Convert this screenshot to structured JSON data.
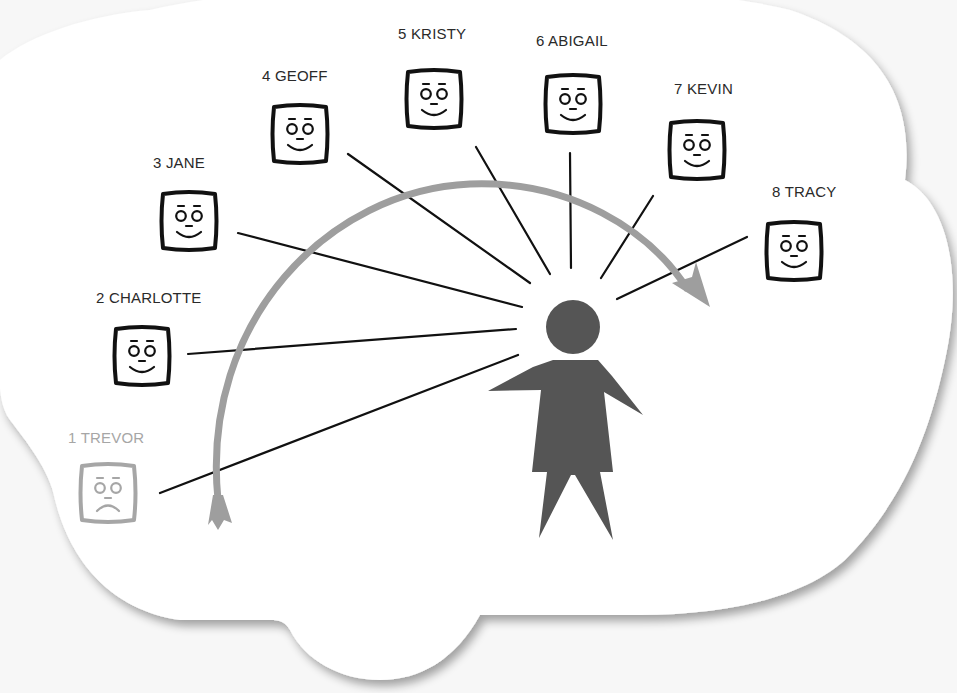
{
  "diagram": {
    "title": "",
    "colors": {
      "cloud_fill": "#ffffff",
      "cloud_shadow": "#bdbdbd",
      "background": "#f7f7f7",
      "line": "#111111",
      "arc": "#9e9e9e",
      "person": "#555555",
      "face_active": "#111111",
      "face_inactive": "#a6a6a6",
      "label_active": "#2a2a2a",
      "label_inactive": "#a6a6a6"
    },
    "central_figure": {
      "icon": "woman-figure-icon",
      "description": "person silhouette in a dress"
    },
    "arc_arrow": {
      "icon": "curved-arrow-icon",
      "direction": "clockwise from 1 to 8"
    },
    "people": [
      {
        "order": "1",
        "name": "TREVOR",
        "label": "1 TREVOR",
        "mood": "sad",
        "active": false
      },
      {
        "order": "2",
        "name": "CHARLOTTE",
        "label": "2 CHARLOTTE",
        "mood": "happy",
        "active": true
      },
      {
        "order": "3",
        "name": "JANE",
        "label": "3 JANE",
        "mood": "happy",
        "active": true
      },
      {
        "order": "4",
        "name": "GEOFF",
        "label": "4 GEOFF",
        "mood": "happy",
        "active": true
      },
      {
        "order": "5",
        "name": "KRISTY",
        "label": "5 KRISTY",
        "mood": "happy",
        "active": true
      },
      {
        "order": "6",
        "name": "ABIGAIL",
        "label": "6 ABIGAIL",
        "mood": "happy",
        "active": true
      },
      {
        "order": "7",
        "name": "KEVIN",
        "label": "7 KEVIN",
        "mood": "happy",
        "active": true
      },
      {
        "order": "8",
        "name": "TRACY",
        "label": "8 TRACY",
        "mood": "happy",
        "active": true
      }
    ]
  }
}
